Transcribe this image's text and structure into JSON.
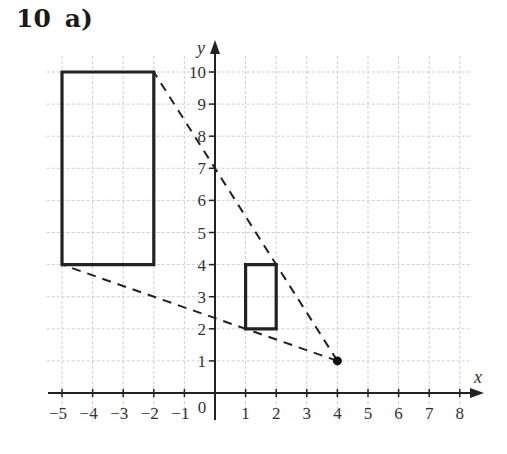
{
  "question": {
    "number": "10",
    "part": "a)"
  },
  "axes": {
    "x_label": "x",
    "y_label": "y",
    "origin_label": "0",
    "x_ticks": [
      "−5",
      "−4",
      "−3",
      "−2",
      "−1",
      "1",
      "2",
      "3",
      "4",
      "5",
      "6",
      "7",
      "8"
    ],
    "y_ticks": [
      "1",
      "2",
      "3",
      "4",
      "5",
      "6",
      "7",
      "8",
      "9",
      "10"
    ]
  },
  "chart_data": {
    "type": "diagram",
    "xlabel": "x",
    "ylabel": "y",
    "xlim": [
      -5,
      8
    ],
    "ylim": [
      0,
      10
    ],
    "grid": true,
    "shapes": [
      {
        "name": "large-rectangle",
        "type": "rectangle",
        "vertices": [
          [
            -5,
            4
          ],
          [
            -2,
            4
          ],
          [
            -2,
            10
          ],
          [
            -5,
            10
          ]
        ],
        "style": "solid"
      },
      {
        "name": "small-rectangle",
        "type": "rectangle",
        "vertices": [
          [
            1,
            2
          ],
          [
            2,
            2
          ],
          [
            2,
            4
          ],
          [
            1,
            4
          ]
        ],
        "style": "solid"
      }
    ],
    "points": [
      {
        "name": "centre-of-enlargement",
        "x": 4,
        "y": 1
      }
    ],
    "rays": [
      {
        "from": [
          4,
          1
        ],
        "to": [
          -2,
          10
        ],
        "style": "dashed"
      },
      {
        "from": [
          4,
          1
        ],
        "to": [
          -5,
          4
        ],
        "style": "dashed"
      }
    ]
  }
}
